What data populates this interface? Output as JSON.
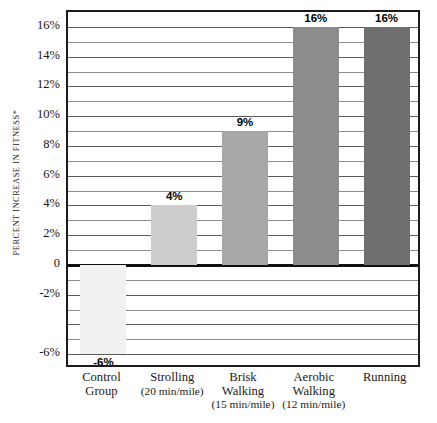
{
  "chart_data": {
    "type": "bar",
    "title": "",
    "xlabel": "",
    "ylabel": "PERCENT INCREASE IN FITNESS*",
    "ylim": [
      -7,
      17
    ],
    "grid": true,
    "grid_interval": 1,
    "legend": "none",
    "categories": [
      "Control Group",
      "Strolling (20 min/mile)",
      "Brisk Walking (15 min/mile)",
      "Aerobic Walking (12 min/mile)",
      "Running"
    ],
    "values": [
      -6,
      4,
      9,
      16,
      16
    ],
    "value_labels": [
      "-6%",
      "4%",
      "9%",
      "16%",
      "16%"
    ],
    "ytick_labels": [
      "16%",
      "14%",
      "12%",
      "10%",
      "8%",
      "6%",
      "4%",
      "2%",
      "0",
      "-2%",
      "-6%"
    ],
    "ytick_values": [
      16,
      14,
      12,
      10,
      8,
      6,
      4,
      2,
      0,
      -2,
      -6
    ],
    "bar_colors": [
      "#f1f1f1",
      "#cdcdcd",
      "#a8a8a8",
      "#8d8d8d",
      "#6f6f6f"
    ]
  },
  "axis": {
    "y_title": "PERCENT INCREASE IN FITNESS*"
  },
  "categories": [
    {
      "line1": "Control",
      "line2": "Group",
      "line3": ""
    },
    {
      "line1": "Strolling",
      "line2": "(20 min/mile)",
      "line3": ""
    },
    {
      "line1": "Brisk",
      "line2": "Walking",
      "line3": "(15 min/mile)"
    },
    {
      "line1": "Aerobic",
      "line2": "Walking",
      "line3": "(12 min/mile)"
    },
    {
      "line1": "Running",
      "line2": "",
      "line3": ""
    }
  ]
}
